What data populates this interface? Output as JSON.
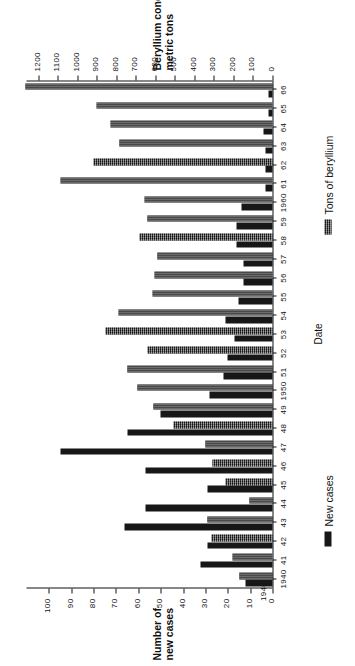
{
  "chart_data": {
    "type": "bar",
    "title": "",
    "orientation": "rotated-90-ccw",
    "xlabel": "Date",
    "categories": [
      "1940",
      "41",
      "42",
      "43",
      "44",
      "45",
      "46",
      "47",
      "48",
      "49",
      "1950",
      "51",
      "52",
      "53",
      "54",
      "55",
      "56",
      "57",
      "58",
      "59",
      "1960",
      "61",
      "62",
      "63",
      "64",
      "65",
      "66"
    ],
    "axes": {
      "cases": {
        "label_line1": "Number of",
        "label_line2": "new cases",
        "ticks": [
          0,
          10,
          20,
          30,
          40,
          50,
          60,
          70,
          80,
          90,
          100
        ],
        "ticklabels": [
          "0",
          "10",
          "20",
          "30",
          "40",
          "50",
          "60",
          "70",
          "80",
          "90",
          "100"
        ],
        "lim": [
          0,
          110
        ],
        "origin_label": "1940"
      },
      "tons": {
        "label_line1": "Beryllium concentrate,",
        "label_line2": "metric tons",
        "ticks": [
          0,
          100,
          200,
          300,
          400,
          500,
          600,
          700,
          800,
          900,
          1000,
          1100,
          1200
        ],
        "ticklabels": [
          "0",
          "100",
          "200",
          "300",
          "400",
          "500",
          "600",
          "700",
          "800",
          "900",
          "1000",
          "1100",
          "1200"
        ],
        "lim": [
          0,
          1260
        ]
      }
    },
    "series": [
      {
        "name": "New cases",
        "key": "cases",
        "color": "#171717",
        "values": [
          12,
          32,
          29,
          66,
          57,
          29,
          57,
          95,
          65,
          50,
          28,
          22,
          20,
          17,
          21,
          15,
          13,
          13,
          16,
          16,
          14,
          3,
          3,
          3,
          4,
          2,
          2
        ]
      },
      {
        "name": "Tons of beryllium",
        "key": "tons",
        "color": "#4a4a4a",
        "values": [
          170,
          205,
          310,
          335,
          120,
          240,
          305,
          345,
          505,
          610,
          690,
          745,
          640,
          855,
          790,
          615,
          605,
          590,
          680,
          640,
          655,
          1085,
          915,
          785,
          830,
          900,
          1265
        ]
      }
    ],
    "legend": {
      "position": "right-of-plot",
      "entries": [
        {
          "label": "New cases",
          "color": "#171717"
        },
        {
          "label": "Tons of beryllium",
          "color": "#4a4a4a"
        }
      ]
    },
    "grid": false
  }
}
